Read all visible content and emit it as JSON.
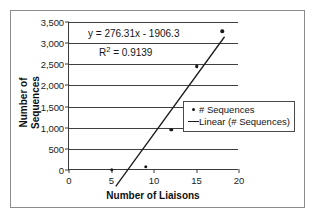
{
  "chart_data": {
    "type": "scatter",
    "title": "",
    "xlabel": "Number of Liaisons",
    "ylabel": "Number of Sequences",
    "ylabel_lines": [
      "Number of",
      "Sequences"
    ],
    "xlim": [
      0,
      20
    ],
    "ylim": [
      0,
      3500
    ],
    "xticks": [
      "0",
      "5",
      "10",
      "15",
      "20"
    ],
    "xtick_values": [
      0,
      5,
      10,
      15,
      20
    ],
    "yticks": [
      "0",
      "500",
      "1,000",
      "1,500",
      "2,000",
      "2,500",
      "3,000",
      "3,500"
    ],
    "ytick_values": [
      0,
      500,
      1000,
      1500,
      2000,
      2500,
      3000,
      3500
    ],
    "grid": "horizontal",
    "legend_position": "center-right",
    "series": [
      {
        "name": "# Sequences",
        "type": "scatter",
        "marker": "dot",
        "color": "#1a1a1a",
        "x": [
          5,
          9,
          12,
          15,
          18
        ],
        "values": [
          10,
          80,
          950,
          2450,
          3280
        ]
      },
      {
        "name": "Linear (# Sequences)",
        "type": "line",
        "color": "#1a1a1a",
        "slope": 276.31,
        "intercept": -1906.3,
        "x": [
          5.5,
          18.3
        ],
        "values": [
          -387.6,
          3151.2
        ]
      }
    ],
    "annotations": {
      "equation": "y = 276.31x - 1906.3",
      "r_squared_prefix": "R",
      "r_squared_exponent": "2",
      "r_squared_value": "= 0.9139"
    },
    "legend": [
      {
        "label": "# Sequences",
        "symbol": "dot-marker"
      },
      {
        "label": "Linear (# Sequences)",
        "symbol": "line-marker"
      }
    ],
    "colors": {
      "axis": "#3a3a3a",
      "grid": "#3f3f3f",
      "frame": "#8c8c8c",
      "data": "#1a1a1a",
      "background": "#ffffff"
    }
  }
}
